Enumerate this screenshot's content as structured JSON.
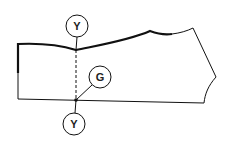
{
  "diagram": {
    "type": "sewing-pattern-piece",
    "labels": {
      "top_marker": "Y",
      "notch_marker": "G",
      "bottom_marker": "Y"
    },
    "colors": {
      "line": "#111111",
      "background": "#ffffff"
    }
  }
}
